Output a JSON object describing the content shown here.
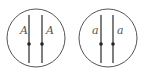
{
  "diagram": {
    "type": "genetics-cell-chromosomes",
    "stroke_color": "#3a3a3a",
    "label_color": "#555555",
    "cells": [
      {
        "name": "cell-dominant",
        "center": [
          36,
          38
        ],
        "radius": 29,
        "chromosomes": [
          {
            "x": 29,
            "label": "A",
            "label_x": 20,
            "label_y": 34
          },
          {
            "x": 42,
            "label": "A",
            "label_x": 46,
            "label_y": 34
          }
        ]
      },
      {
        "name": "cell-recessive",
        "center": [
          108,
          38
        ],
        "radius": 29,
        "chromosomes": [
          {
            "x": 101,
            "label": "a",
            "label_x": 92,
            "label_y": 34
          },
          {
            "x": 113,
            "label": "a",
            "label_x": 117,
            "label_y": 34
          }
        ]
      }
    ]
  }
}
